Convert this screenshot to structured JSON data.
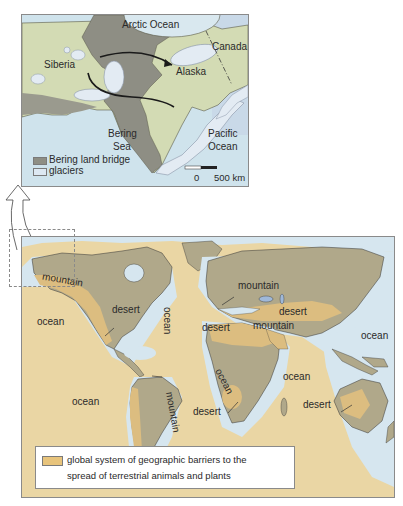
{
  "inset_map": {
    "labels": {
      "arctic_ocean": "Arctic Ocean",
      "canada": "Canada",
      "siberia": "Siberia",
      "alaska": "Alaska",
      "bering_sea_line1": "Bering",
      "bering_sea_line2": "Sea",
      "pacific_ocean_line1": "Pacific",
      "pacific_ocean_line2": "Ocean"
    },
    "legend": [
      {
        "label": "Bering land bridge",
        "color": "#8e8e84"
      },
      {
        "label": "glaciers",
        "color": "#dde8f2"
      }
    ],
    "scale_bar": {
      "start": "0",
      "end": "500 km"
    },
    "colors": {
      "ocean": "#cfe3ec",
      "land": "#d3dbb4",
      "land_bridge": "#8e8e84",
      "glacier": "#e3ebf3"
    }
  },
  "world_map": {
    "labels": {
      "mountain_alaska": "mountain",
      "ocean_pacific_north": "ocean",
      "desert_north_america": "desert",
      "ocean_atlantic": "ocean",
      "mountain_europe": "mountain",
      "desert_sahara": "desert",
      "desert_asia": "desert",
      "mountain_asia": "mountain",
      "ocean_pacific_west": "ocean",
      "mountain_south_america": "mountain",
      "ocean_pacific_south": "ocean",
      "ocean_south_atlantic": "ocean",
      "desert_south_africa": "desert",
      "ocean_indian": "ocean",
      "desert_australia": "desert"
    },
    "legend": {
      "text_line1": "global system of geographic barriers to the",
      "text_line2": "spread of terrestrial animals and plants",
      "color": "#e8c47c"
    },
    "colors": {
      "ocean_barrier": "#ead6a4",
      "land": "#b0a88a",
      "barrier_land": "#dcbd80",
      "coastal_water": "#d6e6ef"
    }
  }
}
